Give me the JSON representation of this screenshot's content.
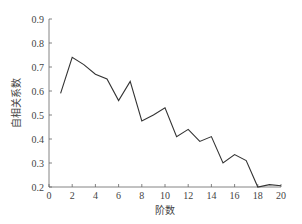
{
  "chart_data": {
    "type": "line",
    "title": "",
    "xlabel": "阶数",
    "ylabel": "自相关系数",
    "xlim": [
      0,
      20
    ],
    "ylim": [
      0.2,
      0.9
    ],
    "x_ticks": [
      0,
      2,
      4,
      6,
      8,
      10,
      12,
      14,
      16,
      18,
      20
    ],
    "y_ticks": [
      0.2,
      0.3,
      0.4,
      0.5,
      0.6,
      0.7,
      0.8,
      0.9
    ],
    "x_tick_labels": [
      "0",
      "2",
      "4",
      "6",
      "8",
      "10",
      "12",
      "14",
      "16",
      "18",
      "20"
    ],
    "y_tick_labels": [
      "0.2",
      "0.3",
      "0.4",
      "0.5",
      "0.6",
      "0.7",
      "0.8",
      "0.9"
    ],
    "grid": false,
    "legend": null,
    "series": [
      {
        "name": "自相关系数",
        "color": "#333333",
        "x": [
          1,
          2,
          3,
          4,
          5,
          6,
          7,
          8,
          9,
          10,
          11,
          12,
          13,
          14,
          15,
          16,
          17,
          18,
          19,
          20
        ],
        "values": [
          0.59,
          0.74,
          0.71,
          0.67,
          0.65,
          0.56,
          0.64,
          0.475,
          0.5,
          0.53,
          0.41,
          0.44,
          0.39,
          0.41,
          0.3,
          0.335,
          0.31,
          0.2,
          0.21,
          0.205
        ]
      }
    ]
  }
}
